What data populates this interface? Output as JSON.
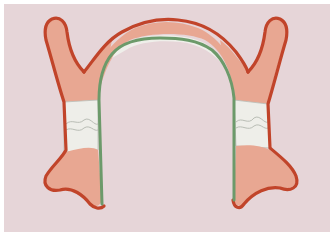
{
  "diagram": {
    "type": "dental-arch-illustration",
    "colors": {
      "background": "#e6d5d8",
      "border": "#ffffff",
      "tissue_fill": "#e8a792",
      "outline_outer": "#c1442a",
      "outline_inner": "#6c9a6a",
      "tooth_fill": "#eeeee9",
      "tooth_line": "#b9bdb5"
    },
    "elements": [
      {
        "id": "arch-outer-outline",
        "label": "outer border (red)"
      },
      {
        "id": "arch-inner-outline",
        "label": "inner border (green)"
      },
      {
        "id": "left-flange-upper",
        "label": "left upper flange"
      },
      {
        "id": "right-flange-upper",
        "label": "right upper flange"
      },
      {
        "id": "left-molars",
        "label": "left molar teeth"
      },
      {
        "id": "right-molars",
        "label": "right molar teeth"
      },
      {
        "id": "left-flange-lower",
        "label": "left lower flange"
      },
      {
        "id": "right-flange-lower",
        "label": "right lower flange"
      }
    ]
  }
}
